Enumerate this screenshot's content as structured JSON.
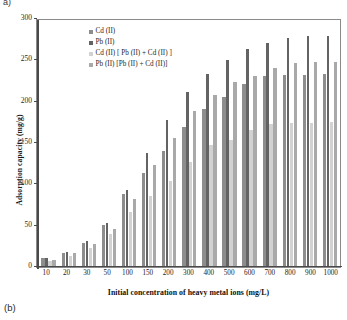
{
  "figure": {
    "panel_letter_top": "a)",
    "panel_letter_bottom": "(b)"
  },
  "colors": {
    "series_cd": "#8d8d8d",
    "series_pb": "#636363",
    "series_cd_mix": "#d2d2d2",
    "series_pb_mix": "#a9a9a9",
    "axis": "#4a4a4a",
    "frame": "#8a8a8a",
    "background": "#ffffff"
  },
  "legend": {
    "position": "top-left-inside",
    "entries": [
      {
        "label": "Cd (II)",
        "color": "#8d8d8d"
      },
      {
        "label": "Pb (II)",
        "color": "#636363"
      },
      {
        "label": "Cd (II) [ Pb (II) + Cd (II) ]",
        "color": "#d2d2d2"
      },
      {
        "label": "Pb (II) [Pb (II) + Cd (II)]",
        "color": "#a9a9a9"
      }
    ]
  },
  "chart_data": {
    "type": "bar",
    "title": "",
    "xlabel": "Initial concentration of heavy metal ions  (mg/L)",
    "ylabel": "Adsorption capacity (mg/g)",
    "categories": [
      "10",
      "20",
      "30",
      "50",
      "100",
      "150",
      "200",
      "300",
      "400",
      "500",
      "600",
      "700",
      "800",
      "900",
      "1000"
    ],
    "ylim": [
      0,
      300
    ],
    "yticks": [
      0,
      50,
      100,
      150,
      200,
      250,
      300
    ],
    "ytick_labels": [
      "0",
      "50",
      "100",
      "150",
      "200",
      "250",
      "300"
    ],
    "grid": false,
    "series": [
      {
        "name": "Cd (II)",
        "color": "#8d8d8d",
        "values": [
          9,
          16,
          28,
          50,
          87,
          112,
          139,
          168,
          190,
          204,
          220,
          230,
          231,
          231,
          232
        ]
      },
      {
        "name": "Pb (II)",
        "color": "#636363",
        "values": [
          9,
          17,
          30,
          52,
          92,
          137,
          176,
          211,
          232,
          249,
          262,
          270,
          276,
          278,
          278
        ]
      },
      {
        "name": "Cd (II) [ Pb (II) + Cd (II) ]",
        "color": "#d2d2d2",
        "values": [
          6,
          12,
          21,
          39,
          65,
          85,
          103,
          126,
          146,
          152,
          164,
          172,
          173,
          173,
          174
        ]
      },
      {
        "name": "Pb (II) [Pb (II) + Cd (II)]",
        "color": "#a9a9a9",
        "values": [
          7,
          15,
          27,
          44,
          81,
          122,
          155,
          188,
          207,
          222,
          230,
          240,
          245,
          247,
          247
        ]
      }
    ]
  }
}
